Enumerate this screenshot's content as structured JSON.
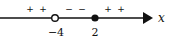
{
  "diagram": {
    "type": "sign-chart-number-line",
    "axis_label": "x",
    "points": [
      {
        "value": "-4",
        "label": "−4",
        "marker": "open"
      },
      {
        "value": "2",
        "label": "2",
        "marker": "filled"
      }
    ],
    "intervals": [
      {
        "range": "(-∞, -4)",
        "signs": [
          "+",
          "+"
        ]
      },
      {
        "range": "(-4, 2)",
        "signs": [
          "−",
          "−"
        ]
      },
      {
        "range": "(2, ∞)",
        "signs": [
          "+",
          "+"
        ]
      }
    ],
    "colors": {
      "line": "#111111",
      "background": "#ffffff"
    }
  }
}
